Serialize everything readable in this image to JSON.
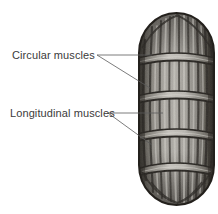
{
  "figure": {
    "background_color": "#ffffff",
    "ink_color": "#3b3b3b",
    "organism": {
      "name": "capsule-shaped-body-segment",
      "shape": "rounded capsule",
      "bounds": {
        "x": 139,
        "y": 15,
        "width": 75,
        "height": 188
      },
      "segment_count": 5,
      "circular_band_count": 4,
      "longitudinal_rib_count": 9,
      "fill_light": "#b9b7b3",
      "fill_mid": "#8f8d89",
      "fill_dark": "#3a3836",
      "outline_color": "#2a2826"
    },
    "labels": [
      {
        "id": "circular-muscles",
        "text": "Circular muscles",
        "text_x": 12,
        "text_y": 59,
        "anchor_x": 97,
        "anchor_y": 55,
        "leaders": [
          {
            "x1": 97,
            "y1": 55,
            "x2": 152,
            "y2": 55
          },
          {
            "x1": 97,
            "y1": 55,
            "x2": 150,
            "y2": 88
          }
        ]
      },
      {
        "id": "longitudinal-muscles",
        "text": "Longitudinal muscles",
        "text_x": 10,
        "text_y": 117,
        "anchor_x": 108,
        "anchor_y": 113,
        "leaders": [
          {
            "x1": 108,
            "y1": 113,
            "x2": 163,
            "y2": 113
          },
          {
            "x1": 108,
            "y1": 113,
            "x2": 152,
            "y2": 145
          }
        ]
      }
    ],
    "bands": [
      {
        "cy": 58,
        "rx": 37,
        "ry": 7
      },
      {
        "cy": 96,
        "rx": 38,
        "ry": 7
      },
      {
        "cy": 134,
        "rx": 38,
        "ry": 7
      },
      {
        "cy": 168,
        "rx": 35,
        "ry": 7
      }
    ],
    "ribs": [
      {
        "offset": -0.92
      },
      {
        "offset": -0.7
      },
      {
        "offset": -0.47
      },
      {
        "offset": -0.23
      },
      {
        "offset": 0.0
      },
      {
        "offset": 0.23
      },
      {
        "offset": 0.47
      },
      {
        "offset": 0.7
      },
      {
        "offset": 0.92
      }
    ]
  }
}
